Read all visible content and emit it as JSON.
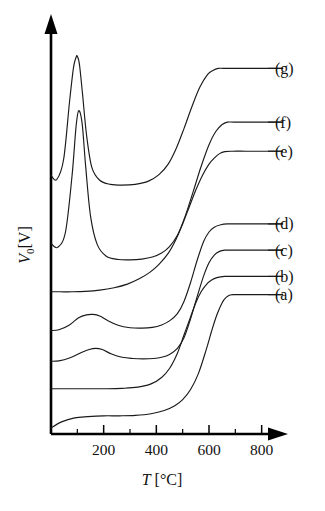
{
  "chart_data": {
    "type": "line",
    "title": "",
    "subtitle": "",
    "xlabel": "T [°C]",
    "xlabel_symbol": "T",
    "xlabel_unit": "[°C]",
    "ylabel": "V0[V]",
    "ylabel_symbol": "V",
    "ylabel_subscript": "0",
    "ylabel_unit": "[V]",
    "xlim": [
      0,
      900
    ],
    "ylim": [
      0,
      1.0
    ],
    "grid": false,
    "legend_position": "right-inline",
    "x_major_ticks": [
      200,
      400,
      600,
      800
    ],
    "x_major_tick_labels": [
      "200",
      "400",
      "600",
      "800"
    ],
    "x_minor_ticks": [
      100,
      300,
      500,
      700,
      900
    ],
    "y_ticks": [],
    "y_tick_labels": [],
    "axis_style": "arrow-headed-L",
    "line_color": "#1a1a1a",
    "background_color": "#ffffff",
    "series": [
      {
        "name": "(a)",
        "label": "(a)",
        "baseline": 0.045,
        "plateau": 0.345,
        "rise_midpoint_c": 600,
        "peak_c": null,
        "peak_height": 0.0,
        "x": [
          0,
          40,
          90,
          140,
          200,
          260,
          320,
          380,
          430,
          470,
          500,
          530,
          560,
          590,
          610,
          630,
          650,
          665,
          680,
          700,
          760,
          830,
          880
        ],
        "y": [
          0.015,
          0.03,
          0.04,
          0.043,
          0.045,
          0.045,
          0.046,
          0.05,
          0.058,
          0.07,
          0.085,
          0.11,
          0.15,
          0.21,
          0.255,
          0.295,
          0.325,
          0.338,
          0.344,
          0.345,
          0.345,
          0.345,
          0.345
        ]
      },
      {
        "name": "(b)",
        "label": "(b)",
        "baseline": 0.112,
        "plateau": 0.39,
        "rise_midpoint_c": 520,
        "peak_c": null,
        "peak_height": 0.0,
        "x": [
          0,
          40,
          90,
          150,
          210,
          270,
          330,
          380,
          420,
          450,
          480,
          505,
          530,
          550,
          570,
          590,
          610,
          630,
          660,
          700,
          770,
          840,
          880
        ],
        "y": [
          0.112,
          0.112,
          0.112,
          0.112,
          0.112,
          0.113,
          0.116,
          0.124,
          0.14,
          0.162,
          0.2,
          0.245,
          0.29,
          0.325,
          0.352,
          0.37,
          0.381,
          0.387,
          0.39,
          0.39,
          0.39,
          0.39,
          0.39
        ]
      },
      {
        "name": "(c)",
        "label": "(c)",
        "baseline": 0.18,
        "plateau": 0.455,
        "rise_midpoint_c": 545,
        "peak_c": 170,
        "peak_height": 0.212,
        "x": [
          0,
          30,
          70,
          110,
          145,
          170,
          195,
          230,
          270,
          310,
          350,
          390,
          420,
          450,
          480,
          505,
          530,
          555,
          580,
          600,
          620,
          640,
          660,
          690,
          740,
          810,
          880
        ],
        "y": [
          0.18,
          0.181,
          0.188,
          0.2,
          0.209,
          0.212,
          0.209,
          0.198,
          0.19,
          0.187,
          0.186,
          0.187,
          0.19,
          0.197,
          0.212,
          0.238,
          0.285,
          0.34,
          0.392,
          0.424,
          0.443,
          0.452,
          0.455,
          0.455,
          0.455,
          0.455,
          0.455
        ]
      },
      {
        "name": "(d)",
        "label": "(d)",
        "baseline": 0.255,
        "plateau": 0.52,
        "rise_midpoint_c": 545,
        "peak_c": 160,
        "peak_height": 0.296,
        "x": [
          0,
          30,
          70,
          105,
          135,
          160,
          185,
          215,
          255,
          300,
          345,
          385,
          420,
          450,
          480,
          505,
          530,
          555,
          580,
          600,
          620,
          645,
          670,
          710,
          780,
          880
        ],
        "y": [
          0.256,
          0.258,
          0.27,
          0.288,
          0.295,
          0.296,
          0.292,
          0.281,
          0.269,
          0.263,
          0.262,
          0.264,
          0.27,
          0.28,
          0.298,
          0.328,
          0.375,
          0.43,
          0.477,
          0.5,
          0.512,
          0.518,
          0.52,
          0.52,
          0.52,
          0.52
        ]
      },
      {
        "name": "(e)",
        "label": "(e)",
        "baseline": 0.352,
        "plateau": 0.7,
        "rise_midpoint_c": 520,
        "peak_c": null,
        "peak_height": 0.0,
        "x": [
          0,
          35,
          80,
          130,
          185,
          240,
          290,
          335,
          375,
          410,
          445,
          475,
          500,
          525,
          550,
          575,
          600,
          620,
          640,
          660,
          690,
          740,
          810,
          880
        ],
        "y": [
          0.352,
          0.352,
          0.352,
          0.353,
          0.356,
          0.362,
          0.371,
          0.384,
          0.4,
          0.42,
          0.447,
          0.482,
          0.52,
          0.562,
          0.604,
          0.64,
          0.668,
          0.683,
          0.694,
          0.699,
          0.7,
          0.7,
          0.7,
          0.7
        ]
      },
      {
        "name": "(f)",
        "label": "(f)",
        "baseline": 0.43,
        "plateau": 0.772,
        "rise_midpoint_c": 500,
        "peak_c": 105,
        "peak_height": 0.8,
        "x": [
          0,
          25,
          55,
          80,
          95,
          105,
          118,
          132,
          150,
          175,
          210,
          255,
          300,
          345,
          385,
          420,
          450,
          480,
          510,
          540,
          570,
          600,
          625,
          650,
          670,
          695,
          750,
          820,
          880
        ],
        "y": [
          0.472,
          0.462,
          0.5,
          0.64,
          0.76,
          0.8,
          0.77,
          0.66,
          0.54,
          0.47,
          0.44,
          0.432,
          0.431,
          0.433,
          0.438,
          0.448,
          0.464,
          0.492,
          0.54,
          0.6,
          0.662,
          0.716,
          0.748,
          0.766,
          0.772,
          0.772,
          0.772,
          0.772,
          0.772
        ]
      },
      {
        "name": "(g)",
        "label": "(g)",
        "baseline": 0.62,
        "plateau": 0.905,
        "rise_midpoint_c": 480,
        "peak_c": 100,
        "peak_height": 0.935,
        "x": [
          0,
          22,
          48,
          70,
          85,
          95,
          100,
          108,
          120,
          135,
          155,
          185,
          225,
          270,
          320,
          370,
          410,
          445,
          475,
          505,
          535,
          565,
          595,
          615,
          635,
          655,
          700,
          780,
          880
        ],
        "y": [
          0.64,
          0.63,
          0.68,
          0.82,
          0.905,
          0.932,
          0.935,
          0.915,
          0.84,
          0.74,
          0.66,
          0.628,
          0.618,
          0.616,
          0.618,
          0.626,
          0.642,
          0.668,
          0.706,
          0.756,
          0.81,
          0.858,
          0.89,
          0.9,
          0.905,
          0.905,
          0.905,
          0.905,
          0.905
        ]
      }
    ],
    "annotations": []
  }
}
